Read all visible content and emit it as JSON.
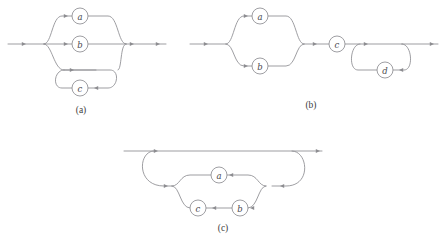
{
  "figure": {
    "background_color": "#ffffff",
    "stroke_color": "#8d8d91",
    "label_color": "#4a4a4e",
    "caption_color": "#3d3d40"
  },
  "panels": [
    {
      "id": "panel-a",
      "caption": "(a)",
      "caption_x": 81,
      "caption_y": 110,
      "nodes": [
        {
          "id": "a",
          "label": "a",
          "cx": 80,
          "cy": 16,
          "r": 8
        },
        {
          "id": "b",
          "label": "b",
          "cx": 80,
          "cy": 44,
          "r": 8
        },
        {
          "id": "c",
          "label": "c",
          "cx": 80,
          "cy": 88,
          "r": 8
        }
      ],
      "entry_arrow": {
        "x": 22,
        "y": 44
      },
      "exit_arrow": {
        "x": 160,
        "y": 44
      }
    },
    {
      "id": "panel-b",
      "caption": "(b)",
      "caption_x": 311,
      "caption_y": 105,
      "nodes": [
        {
          "id": "a",
          "label": "a",
          "cx": 260,
          "cy": 16,
          "r": 8
        },
        {
          "id": "b",
          "label": "b",
          "cx": 260,
          "cy": 66,
          "r": 8
        },
        {
          "id": "c",
          "label": "c",
          "cx": 337,
          "cy": 44,
          "r": 8
        },
        {
          "id": "d",
          "label": "d",
          "cx": 385,
          "cy": 70,
          "r": 8
        }
      ],
      "entry_arrow": {
        "x": 206,
        "y": 44
      },
      "exit_arrow": {
        "x": 432,
        "y": 44
      }
    },
    {
      "id": "panel-c",
      "caption": "(c)",
      "caption_x": 223,
      "caption_y": 228,
      "nodes": [
        {
          "id": "a",
          "label": "a",
          "cx": 219,
          "cy": 175,
          "r": 8
        },
        {
          "id": "b",
          "label": "b",
          "cx": 240,
          "cy": 208,
          "r": 8
        },
        {
          "id": "c",
          "label": "c",
          "cx": 198,
          "cy": 208,
          "r": 8
        }
      ],
      "entry_arrow": {
        "x": 158,
        "y": 151
      },
      "exit_arrow": {
        "x": 318,
        "y": 151
      }
    }
  ]
}
